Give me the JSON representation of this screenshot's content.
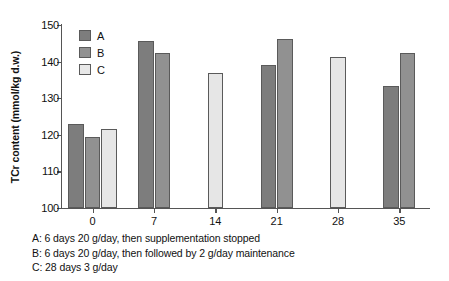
{
  "chart_data": {
    "type": "bar",
    "title": "",
    "xlabel": "",
    "ylabel": "TCr content (mmol/kg d.w.)",
    "ylim": [
      100,
      150
    ],
    "yticks": [
      100,
      110,
      120,
      130,
      140,
      150
    ],
    "ytick_labels": [
      "100",
      "110",
      "120",
      "130",
      "140",
      "150"
    ],
    "categories": [
      "0",
      "7",
      "14",
      "21",
      "28",
      "35"
    ],
    "xtick_labels": [
      "0",
      "7",
      "14",
      "21",
      "28",
      "35"
    ],
    "grid": false,
    "legend_position": "upper-left-inside",
    "series": [
      {
        "name": "A",
        "color": "#7d7d7d",
        "values": [
          123.0,
          145.7,
          null,
          139.0,
          null,
          133.4
        ]
      },
      {
        "name": "B",
        "color": "#919191",
        "values": [
          119.3,
          142.4,
          null,
          146.2,
          null,
          142.4
        ]
      },
      {
        "name": "C",
        "color": "#e6e6e6",
        "values": [
          121.5,
          null,
          137.0,
          null,
          141.2,
          null
        ]
      }
    ],
    "annotations": [
      "A: 6 days 20 g/day, then supplementation stopped",
      "B: 6 days 20 g/day, then followed by 2 g/day maintenance",
      "C: 28 days 3 g/day"
    ]
  },
  "legend": {
    "entries": [
      {
        "label": "A",
        "color": "#7d7d7d"
      },
      {
        "label": "B",
        "color": "#919191"
      },
      {
        "label": "C",
        "color": "#e8e8e8"
      }
    ]
  },
  "caption": {
    "lines": [
      "A: 6 days 20 g/day, then supplementation stopped",
      "B: 6 days 20 g/day, then followed by 2 g/day maintenance",
      "C: 28 days 3 g/day"
    ]
  }
}
